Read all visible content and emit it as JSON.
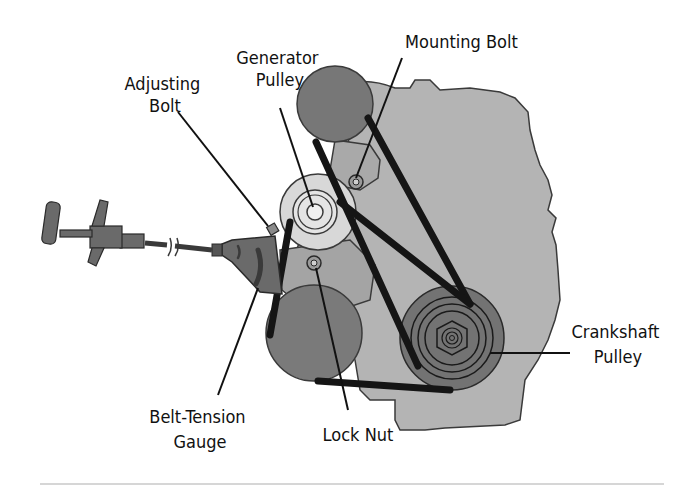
{
  "diagram": {
    "labels": {
      "adjusting_bolt": [
        "Adjusting",
        "Bolt"
      ],
      "generator_pulley": [
        "Generator",
        "Pulley"
      ],
      "mounting_bolt": [
        "Mounting Bolt"
      ],
      "crankshaft_pulley": [
        "Crankshaft",
        "Pulley"
      ],
      "belt_tension_gauge": [
        "Belt-Tension",
        "Gauge"
      ],
      "lock_nut": [
        "Lock Nut"
      ]
    },
    "components": [
      "engine-block",
      "upper-pulley",
      "generator-pulley",
      "lower-left-pulley",
      "crankshaft-pulley",
      "drive-belt",
      "adjusting-bolt",
      "mounting-bolt",
      "lock-nut",
      "belt-tension-gauge"
    ],
    "colors": {
      "background": "#ffffff",
      "engine_block": "#b4b4b4",
      "pulley_dark": "#777777",
      "generator_light": "#d8d8d8",
      "belt": "#151515",
      "gauge": "#6a6a6a",
      "text": "#111111",
      "rule": "#d6d6d6"
    }
  }
}
